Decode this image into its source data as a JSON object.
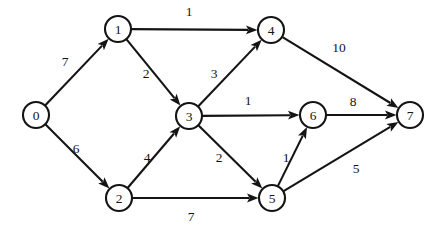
{
  "figure": {
    "background_color": "#ffffff",
    "stroke_color": "#141414",
    "node_fill_color": "#ffffff",
    "width": 443,
    "height": 230
  },
  "graph": {
    "type": "directed-weighted-graph",
    "node_radius": 13,
    "nodes": [
      {
        "id": "0",
        "label": "0",
        "x": 36,
        "y": 115
      },
      {
        "id": "1",
        "label": "1",
        "x": 118,
        "y": 29
      },
      {
        "id": "2",
        "label": "2",
        "x": 119,
        "y": 198
      },
      {
        "id": "3",
        "label": "3",
        "x": 189,
        "y": 116
      },
      {
        "id": "4",
        "label": "4",
        "x": 271,
        "y": 30
      },
      {
        "id": "5",
        "label": "5",
        "x": 272,
        "y": 198
      },
      {
        "id": "6",
        "label": "6",
        "x": 313,
        "y": 115
      },
      {
        "id": "7",
        "label": "7",
        "x": 410,
        "y": 115
      }
    ],
    "edges": [
      {
        "id": "e0-1",
        "from": "0",
        "to": "1",
        "weight": "7",
        "label_x": 65,
        "label_y": 61
      },
      {
        "id": "e0-2",
        "from": "0",
        "to": "2",
        "weight": "6",
        "label_x": 76,
        "label_y": 148
      },
      {
        "id": "e1-4",
        "from": "1",
        "to": "4",
        "weight": "1",
        "label_x": 189,
        "label_y": 11
      },
      {
        "id": "e1-3",
        "from": "1",
        "to": "3",
        "weight": "2",
        "label_x": 146,
        "label_y": 73
      },
      {
        "id": "e3-4",
        "from": "3",
        "to": "4",
        "weight": "3",
        "label_x": 214,
        "label_y": 73
      },
      {
        "id": "e4-7",
        "from": "4",
        "to": "7",
        "weight": "10",
        "label_x": 339,
        "label_y": 47
      },
      {
        "id": "e3-6",
        "from": "3",
        "to": "6",
        "weight": "1",
        "label_x": 248,
        "label_y": 100
      },
      {
        "id": "e6-7",
        "from": "6",
        "to": "7",
        "weight": "8",
        "label_x": 353,
        "label_y": 101
      },
      {
        "id": "e2-3",
        "from": "2",
        "to": "3",
        "weight": "4",
        "label_x": 147,
        "label_y": 157
      },
      {
        "id": "e3-5",
        "from": "3",
        "to": "5",
        "weight": "2",
        "label_x": 219,
        "label_y": 157
      },
      {
        "id": "e5-6",
        "from": "5",
        "to": "6",
        "weight": "1",
        "label_x": 286,
        "label_y": 157
      },
      {
        "id": "e2-5",
        "from": "2",
        "to": "5",
        "weight": "7",
        "label_x": 191,
        "label_y": 216
      },
      {
        "id": "e5-7",
        "from": "5",
        "to": "7",
        "weight": "5",
        "label_x": 356,
        "label_y": 168
      }
    ]
  }
}
